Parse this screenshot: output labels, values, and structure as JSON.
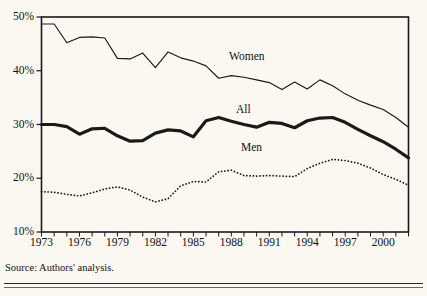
{
  "title": "",
  "source_note": "Source: Authors' analysis.",
  "axis": {
    "y_ticks": [
      "10%",
      "20%",
      "30%",
      "40%",
      "50%"
    ],
    "x_ticks": [
      "1973",
      "1976",
      "1979",
      "1982",
      "1985",
      "1988",
      "1991",
      "1994",
      "1997",
      "2000"
    ]
  },
  "labels": {
    "women": "Women",
    "all": "All",
    "men": "Men"
  },
  "colors": {
    "ink": "#1a1a1a",
    "background": "#faf8f0"
  },
  "chart_data": {
    "type": "line",
    "title": "",
    "xlabel": "",
    "ylabel": "",
    "xlim": [
      1973,
      2002
    ],
    "ylim": [
      10,
      50
    ],
    "grid": false,
    "legend": "inline-annotations",
    "x": [
      1973,
      1974,
      1975,
      1976,
      1977,
      1978,
      1979,
      1980,
      1981,
      1982,
      1983,
      1984,
      1985,
      1986,
      1987,
      1988,
      1989,
      1990,
      1991,
      1992,
      1993,
      1994,
      1995,
      1996,
      1997,
      1998,
      1999,
      2000,
      2001,
      2002
    ],
    "series": [
      {
        "name": "Women",
        "style": "solid-thin",
        "values": [
          48.7,
          48.7,
          45.2,
          46.2,
          46.3,
          46.1,
          42.3,
          42.2,
          43.3,
          40.6,
          43.5,
          42.4,
          41.8,
          40.9,
          38.6,
          39.1,
          38.8,
          38.3,
          37.8,
          36.5,
          37.9,
          36.6,
          38.3,
          37.2,
          35.7,
          34.5,
          33.6,
          32.8,
          31.3,
          29.5
        ]
      },
      {
        "name": "All",
        "style": "solid-bold",
        "values": [
          30.0,
          30.0,
          29.6,
          28.2,
          29.2,
          29.3,
          27.9,
          26.9,
          27.0,
          28.4,
          29.0,
          28.8,
          27.7,
          30.7,
          31.3,
          30.6,
          30.0,
          29.5,
          30.4,
          30.2,
          29.4,
          30.7,
          31.2,
          31.3,
          30.4,
          29.1,
          27.9,
          26.8,
          25.4,
          23.8
        ]
      },
      {
        "name": "Men",
        "style": "dotted",
        "values": [
          17.5,
          17.4,
          17.0,
          16.7,
          17.3,
          18.0,
          18.4,
          17.8,
          16.5,
          15.6,
          16.2,
          18.6,
          19.4,
          19.3,
          21.2,
          21.5,
          20.5,
          20.4,
          20.5,
          20.4,
          20.3,
          21.8,
          22.8,
          23.5,
          23.3,
          22.8,
          21.9,
          20.7,
          19.8,
          18.7
        ]
      }
    ]
  }
}
